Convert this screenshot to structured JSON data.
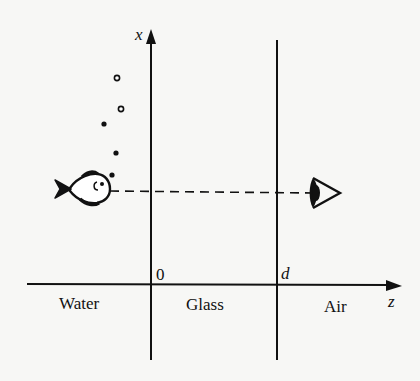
{
  "figure": {
    "axes": {
      "vertical_label": "x",
      "horizontal_label": "z"
    },
    "interface_labels": {
      "origin": "0",
      "glass_air": "d"
    },
    "regions": [
      {
        "key": "water",
        "label": "Water"
      },
      {
        "key": "glass",
        "label": "Glass"
      },
      {
        "key": "air",
        "label": "Air"
      }
    ],
    "objects": {
      "fish": "fish-in-water",
      "eye": "observer-eye-in-air",
      "sight_line": "dashed-line-of-sight"
    },
    "bubbles": [
      {
        "cx": 117,
        "cy": 78,
        "hollow": true
      },
      {
        "cx": 121,
        "cy": 109,
        "hollow": true
      },
      {
        "cx": 104,
        "cy": 124,
        "hollow": false
      },
      {
        "cx": 116,
        "cy": 153,
        "hollow": false
      },
      {
        "cx": 112,
        "cy": 175,
        "hollow": false
      }
    ],
    "colors": {
      "ink": "#111111",
      "paper": "#f7f7f5"
    }
  }
}
